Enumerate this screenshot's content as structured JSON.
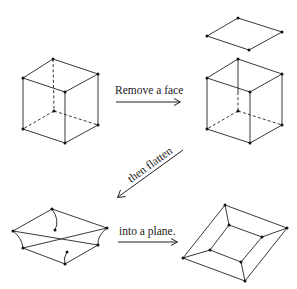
{
  "diagram": {
    "steps": [
      {
        "id": "step1",
        "label": "Remove a face"
      },
      {
        "id": "step2",
        "label": "then flatten"
      },
      {
        "id": "step3",
        "label": "into a plane."
      }
    ],
    "figures": {
      "cube_original": {
        "vertices": {
          "back_top": [
            53,
            59
          ],
          "left_top": [
            23,
            78
          ],
          "right_top": [
            98,
            74
          ],
          "front_top": [
            65,
            92
          ],
          "back_bottom": [
            54,
            111
          ],
          "left_bottom": [
            23,
            129
          ],
          "right_bottom": [
            98,
            125
          ],
          "front_bottom": [
            65,
            143
          ]
        },
        "hidden_edges": [
          "back_top-back_bottom",
          "back_bottom-left_bottom",
          "back_bottom-right_bottom"
        ]
      },
      "removed_face": {
        "vertices": {
          "top": [
            238,
            18
          ],
          "left": [
            207,
            36
          ],
          "right": [
            282,
            32
          ],
          "bottom": [
            249,
            50
          ]
        }
      },
      "cube_open": {
        "vertices": {
          "back_top": [
            238,
            59
          ],
          "left_top": [
            207,
            78
          ],
          "right_top": [
            282,
            74
          ],
          "front_top": [
            250,
            92
          ],
          "back_bottom": [
            238,
            111
          ],
          "left_bottom": [
            207,
            129
          ],
          "right_bottom": [
            282,
            125
          ],
          "front_bottom": [
            250,
            143
          ]
        }
      },
      "cube_flattening": {
        "vertices": {
          "outer_top": [
            52,
            209
          ],
          "outer_left": [
            13,
            231
          ],
          "outer_right": [
            107,
            228
          ],
          "outer_bottom": [
            65,
            264
          ],
          "inner_top": [
            55,
            230
          ],
          "inner_left": [
            23,
            248
          ],
          "inner_right": [
            98,
            245
          ],
          "inner_bottom": [
            67,
            252
          ]
        }
      },
      "planar_graph": {
        "vertices": {
          "outer_top": [
            225,
            205
          ],
          "outer_right": [
            287,
            228
          ],
          "outer_left": [
            183,
            258
          ],
          "outer_bottom": [
            245,
            281
          ],
          "inner_top": [
            229,
            225
          ],
          "inner_right": [
            262,
            237
          ],
          "inner_left": [
            210,
            250
          ],
          "inner_bottom": [
            241,
            262
          ]
        }
      }
    },
    "colors": {
      "line": "#222222",
      "vertex": "#111111",
      "background": "#ffffff"
    }
  }
}
